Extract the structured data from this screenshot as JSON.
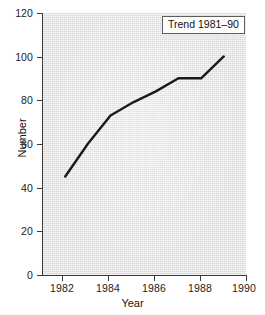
{
  "chart_data": {
    "type": "line",
    "title": "",
    "xlabel": "Year",
    "ylabel": "Number",
    "xlim": [
      1981,
      1990
    ],
    "ylim": [
      0,
      120
    ],
    "xticks": [
      1982,
      1984,
      1986,
      1988,
      1990
    ],
    "yticks": [
      0,
      20,
      40,
      60,
      80,
      100,
      120
    ],
    "grid": false,
    "legend_position": "top-right",
    "annotation": "Trend 1981–90",
    "series": [
      {
        "name": "Trend 1981–90",
        "color": "#1a1a1a",
        "linewidth": 2.4,
        "marker": "none",
        "x": [
          1982,
          1983,
          1984,
          1985,
          1986,
          1987,
          1988,
          1989
        ],
        "values": [
          45,
          60,
          73,
          79,
          84,
          90,
          90,
          100
        ]
      }
    ]
  },
  "axes": {
    "y": {
      "title": "Number",
      "ticklabels": [
        "0",
        "20",
        "40",
        "60",
        "80",
        "100",
        "120"
      ]
    },
    "x": {
      "title": "Year",
      "ticklabels": [
        "1982",
        "1984",
        "1986",
        "1988",
        "1990"
      ]
    }
  },
  "legend": {
    "label": "Trend 1981–90"
  },
  "style": {
    "page_background": "#ffffff",
    "plot_background": "#e3e3e3",
    "axis_color": "#3a3a3a",
    "line_color": "#1a1a1a",
    "text_color": "#141414",
    "legend_background": "#fdfdfd",
    "legend_border": "#5c5c5c"
  }
}
